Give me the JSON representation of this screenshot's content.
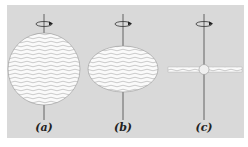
{
  "figure": {
    "background": "#d9d9d9",
    "panels": [
      {
        "label": "(a)",
        "shape": "sphere",
        "description": "spherical cloud rotating slowly"
      },
      {
        "label": "(b)",
        "shape": "oblate spheroid",
        "description": "flattened cloud rotating faster"
      },
      {
        "label": "(c)",
        "shape": "disk",
        "description": "thin disk with central bulge"
      }
    ],
    "axis_icon": "rotation-arrow-icon"
  }
}
